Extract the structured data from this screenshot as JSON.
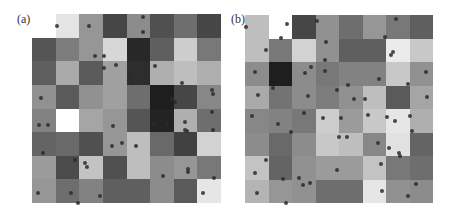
{
  "figure": {
    "panels": [
      {
        "label": "(a)",
        "label_pos": [
          17,
          13
        ],
        "grid_box": [
          32,
          14,
          189,
          189
        ],
        "rows": 8,
        "cols": 8,
        "gray_levels": [
          [
            255,
            228,
            150,
            70,
            140,
            80,
            110,
            70
          ],
          [
            85,
            125,
            150,
            215,
            40,
            95,
            205,
            120
          ],
          [
            95,
            170,
            90,
            160,
            45,
            175,
            190,
            175
          ],
          [
            145,
            90,
            145,
            160,
            110,
            30,
            70,
            135
          ],
          [
            130,
            255,
            165,
            150,
            85,
            35,
            175,
            110
          ],
          [
            100,
            105,
            80,
            150,
            190,
            105,
            65,
            210
          ],
          [
            155,
            75,
            195,
            80,
            190,
            140,
            150,
            120
          ],
          [
            150,
            110,
            130,
            95,
            95,
            140,
            90,
            230
          ]
        ],
        "dots": [
          [
            57,
            26
          ],
          [
            89,
            26
          ],
          [
            143,
            17
          ],
          [
            143,
            32
          ],
          [
            95,
            56
          ],
          [
            104,
            56
          ],
          [
            104,
            68
          ],
          [
            116,
            65
          ],
          [
            129,
            78
          ],
          [
            131,
            83
          ],
          [
            155,
            66
          ],
          [
            182,
            83
          ],
          [
            212,
            90
          ],
          [
            213,
            94
          ],
          [
            41,
            98
          ],
          [
            172,
            99
          ],
          [
            175,
            102
          ],
          [
            39,
            125
          ],
          [
            48,
            125
          ],
          [
            113,
            126
          ],
          [
            154,
            124
          ],
          [
            167,
            123
          ],
          [
            212,
            112
          ],
          [
            185,
            122
          ],
          [
            185,
            130
          ],
          [
            112,
            146
          ],
          [
            122,
            143
          ],
          [
            136,
            146
          ],
          [
            187,
            131
          ],
          [
            213,
            130
          ],
          [
            43,
            153
          ],
          [
            75,
            160
          ],
          [
            85,
            163
          ],
          [
            87,
            167
          ],
          [
            163,
            176
          ],
          [
            188,
            169
          ],
          [
            188,
            172
          ],
          [
            214,
            178
          ],
          [
            38,
            193
          ],
          [
            71,
            193
          ],
          [
            78,
            203
          ],
          [
            100,
            196
          ],
          [
            203,
            193
          ]
        ]
      },
      {
        "label": "(b)",
        "label_pos": [
          231,
          13
        ],
        "grid_box": [
          245,
          15,
          188,
          188
        ],
        "rows": 8,
        "cols": 8,
        "gray_levels": [
          [
            190,
            255,
            70,
            145,
            110,
            150,
            120,
            95
          ],
          [
            190,
            120,
            210,
            145,
            95,
            95,
            235,
            200
          ],
          [
            140,
            30,
            140,
            120,
            130,
            130,
            200,
            145
          ],
          [
            170,
            115,
            140,
            125,
            145,
            190,
            90,
            165
          ],
          [
            135,
            130,
            120,
            205,
            155,
            200,
            230,
            175
          ],
          [
            140,
            105,
            140,
            200,
            190,
            135,
            225,
            100
          ],
          [
            195,
            100,
            145,
            155,
            155,
            195,
            120,
            110
          ],
          [
            180,
            150,
            145,
            110,
            110,
            230,
            145,
            140
          ]
        ],
        "dots": [
          [
            246,
            27
          ],
          [
            287,
            24
          ],
          [
            317,
            21
          ],
          [
            396,
            19
          ],
          [
            385,
            37
          ],
          [
            266,
            50
          ],
          [
            281,
            38
          ],
          [
            325,
            60
          ],
          [
            326,
            42
          ],
          [
            393,
            52
          ],
          [
            391,
            55
          ],
          [
            255,
            72
          ],
          [
            305,
            73
          ],
          [
            311,
            67
          ],
          [
            348,
            85
          ],
          [
            325,
            71
          ],
          [
            379,
            79
          ],
          [
            426,
            72
          ],
          [
            408,
            84
          ],
          [
            258,
            95
          ],
          [
            273,
            88
          ],
          [
            308,
            96
          ],
          [
            337,
            90
          ],
          [
            354,
            99
          ],
          [
            365,
            99
          ],
          [
            427,
            97
          ],
          [
            252,
            116
          ],
          [
            278,
            124
          ],
          [
            304,
            113
          ],
          [
            323,
            118
          ],
          [
            341,
            118
          ],
          [
            368,
            115
          ],
          [
            387,
            117
          ],
          [
            395,
            121
          ],
          [
            410,
            116
          ],
          [
            412,
            131
          ],
          [
            266,
            160
          ],
          [
            291,
            132
          ],
          [
            339,
            137
          ],
          [
            347,
            137
          ],
          [
            378,
            143
          ],
          [
            389,
            148
          ],
          [
            399,
            153
          ],
          [
            255,
            173
          ],
          [
            283,
            179
          ],
          [
            299,
            178
          ],
          [
            303,
            185
          ],
          [
            310,
            183
          ],
          [
            337,
            170
          ],
          [
            381,
            164
          ],
          [
            400,
            156
          ],
          [
            257,
            193
          ],
          [
            286,
            203
          ],
          [
            382,
            191
          ],
          [
            416,
            184
          ],
          [
            408,
            196
          ]
        ]
      }
    ]
  }
}
